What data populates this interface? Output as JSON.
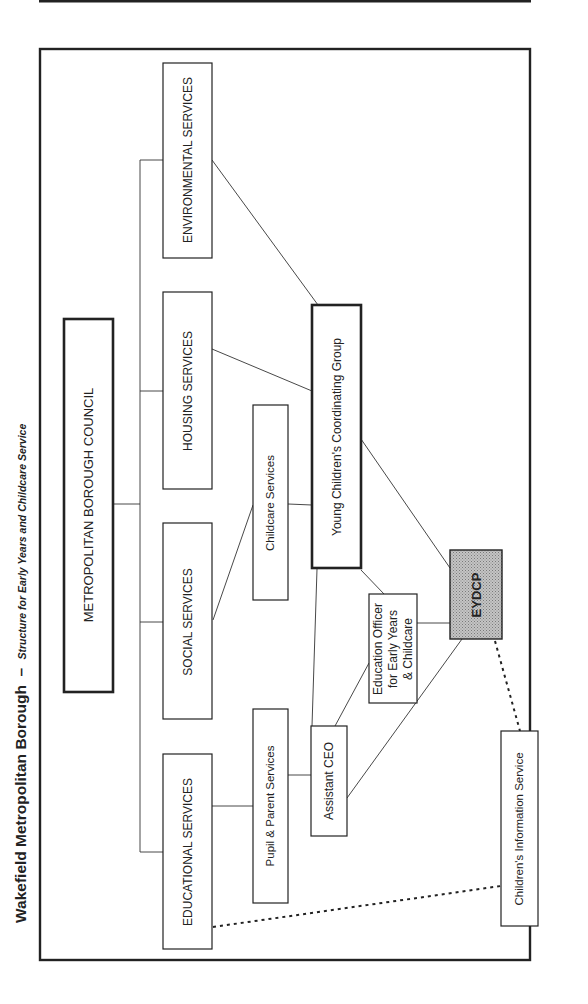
{
  "title": {
    "main": "Wakefield Metropolitan Borough",
    "separator": "–",
    "subtitle": "Structure for Early Years and Childcare Service"
  },
  "nodes": {
    "council": {
      "label": "METROPOLITAN BOROUGH COUNCIL"
    },
    "environmental": {
      "label": "ENVIRONMENTAL SERVICES"
    },
    "housing": {
      "label": "HOUSING SERVICES"
    },
    "social": {
      "label": "SOCIAL SERVICES"
    },
    "educational": {
      "label": "EDUCATIONAL SERVICES"
    },
    "childcare": {
      "label": "Childcare Services"
    },
    "yccg": {
      "label": "Young Children's Coordinating Group"
    },
    "pupil_parent": {
      "label": "Pupil & Parent Services"
    },
    "assistant_ceo": {
      "label": "Assistant CEO"
    },
    "education_officer": {
      "lines": [
        "Education Officer",
        "for Early Years",
        "& Childcare"
      ]
    },
    "eydcp": {
      "label": "EYDCP",
      "fill": "#b8b8b8"
    },
    "cis": {
      "label": "Children's Information Service"
    }
  },
  "connections": [
    {
      "from": "council",
      "to": "environmental",
      "style": "solid"
    },
    {
      "from": "council",
      "to": "housing",
      "style": "solid"
    },
    {
      "from": "council",
      "to": "social",
      "style": "solid"
    },
    {
      "from": "council",
      "to": "educational",
      "style": "solid"
    },
    {
      "from": "environmental",
      "to": "yccg",
      "style": "solid"
    },
    {
      "from": "housing",
      "to": "yccg",
      "style": "solid"
    },
    {
      "from": "social",
      "to": "childcare",
      "style": "solid"
    },
    {
      "from": "childcare",
      "to": "yccg",
      "style": "solid"
    },
    {
      "from": "educational",
      "to": "pupil_parent",
      "style": "solid"
    },
    {
      "from": "pupil_parent",
      "to": "assistant_ceo",
      "style": "solid"
    },
    {
      "from": "assistant_ceo",
      "to": "yccg",
      "style": "solid"
    },
    {
      "from": "assistant_ceo",
      "to": "education_officer",
      "style": "solid"
    },
    {
      "from": "assistant_ceo",
      "to": "eydcp",
      "style": "solid"
    },
    {
      "from": "yccg",
      "to": "education_officer",
      "style": "solid"
    },
    {
      "from": "yccg",
      "to": "eydcp",
      "style": "solid"
    },
    {
      "from": "education_officer",
      "to": "eydcp",
      "style": "solid"
    },
    {
      "from": "eydcp",
      "to": "cis",
      "style": "dotted"
    },
    {
      "from": "educational",
      "to": "cis",
      "style": "dotted"
    }
  ]
}
